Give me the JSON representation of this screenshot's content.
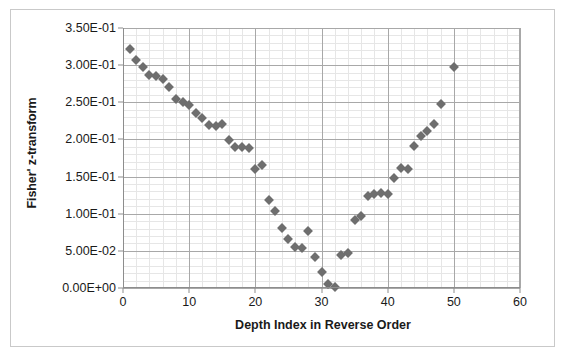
{
  "chart_data": {
    "type": "scatter",
    "title": "",
    "xlabel": "Depth Index in Reverse Order",
    "ylabel": "Fisher' z-transform",
    "xlim": [
      0,
      60
    ],
    "ylim": [
      0,
      0.35
    ],
    "xticks": [
      0,
      10,
      20,
      30,
      40,
      50,
      60
    ],
    "xticklabels": [
      "0",
      "10",
      "20",
      "30",
      "40",
      "50",
      "60"
    ],
    "yticks": [
      0,
      0.05,
      0.1,
      0.15,
      0.2,
      0.25,
      0.3,
      0.35
    ],
    "yticklabels": [
      "0.00E+00",
      "5.00E-02",
      "1.00E-01",
      "1.50E-01",
      "2.00E-01",
      "2.50E-01",
      "3.00E-01",
      "3.50E-01"
    ],
    "grid": true,
    "minor_grid": true,
    "x_minor_step": 2,
    "y_minor_step": 0.01,
    "legend": "none",
    "marker": "diamond",
    "marker_color": "#6e6e6e",
    "series": [
      {
        "name": "Fisher z",
        "x": [
          1,
          2,
          3,
          4,
          5,
          6,
          7,
          8,
          9,
          10,
          11,
          12,
          13,
          14,
          15,
          16,
          17,
          18,
          19,
          20,
          21,
          22,
          23,
          24,
          25,
          26,
          27,
          28,
          29,
          30,
          31,
          32,
          33,
          34,
          35,
          36,
          37,
          38,
          39,
          40,
          41,
          42,
          43,
          44,
          45,
          46,
          47,
          48,
          50
        ],
        "y": [
          0.322,
          0.307,
          0.297,
          0.287,
          0.285,
          0.281,
          0.271,
          0.255,
          0.251,
          0.247,
          0.236,
          0.229,
          0.219,
          0.218,
          0.221,
          0.199,
          0.19,
          0.19,
          0.189,
          0.16,
          0.166,
          0.118,
          0.104,
          0.081,
          0.066,
          0.055,
          0.054,
          0.077,
          0.042,
          0.021,
          0.006,
          0.001,
          0.045,
          0.047,
          0.091,
          0.097,
          0.124,
          0.126,
          0.128,
          0.127,
          0.148,
          0.161,
          0.16,
          0.191,
          0.204,
          0.212,
          0.221,
          0.248,
          0.298
        ]
      }
    ]
  }
}
